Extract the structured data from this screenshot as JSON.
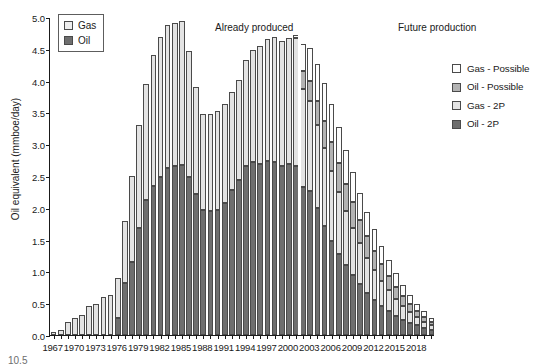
{
  "chart_data": {
    "type": "bar",
    "title": "",
    "xlabel": "",
    "ylabel": "Oil equivalent (mmboe/day)",
    "ylim": [
      0,
      5.0
    ],
    "ytick_labels": [
      "0.0",
      "0.5",
      "1.0",
      "1.5",
      "2.0",
      "2.5",
      "3.0",
      "3.5",
      "4.0",
      "4.5",
      "5.0"
    ],
    "ytick_values": [
      0,
      0.5,
      1.0,
      1.5,
      2.0,
      2.5,
      3.0,
      3.5,
      4.0,
      4.5,
      5.0
    ],
    "grid": false,
    "stacked": true,
    "legend_position": "right",
    "annotations": [
      {
        "text": "Already produced",
        "x": 1988
      },
      {
        "text": "Future production",
        "x": 2012
      }
    ],
    "divider_year": 2001.5,
    "categories": [
      1967,
      1968,
      1969,
      1970,
      1971,
      1972,
      1973,
      1974,
      1975,
      1976,
      1977,
      1978,
      1979,
      1980,
      1981,
      1982,
      1983,
      1984,
      1985,
      1986,
      1987,
      1988,
      1989,
      1990,
      1991,
      1992,
      1993,
      1994,
      1995,
      1996,
      1997,
      1998,
      1999,
      2000,
      2001,
      2002,
      2003,
      2004,
      2005,
      2006,
      2007,
      2008,
      2009,
      2010,
      2011,
      2012,
      2013,
      2014,
      2015,
      2016,
      2017,
      2018,
      2019,
      2020
    ],
    "xtick_labels": [
      "1967",
      "1970",
      "1973",
      "1976",
      "1979",
      "1982",
      "1985",
      "1988",
      "1991",
      "1994",
      "1997",
      "2000",
      "2003",
      "2006",
      "2009",
      "2012",
      "2015",
      "2018"
    ],
    "series": [
      {
        "name": "Oil - 2P",
        "color": "#6e6e6e",
        "values": [
          0.0,
          0.0,
          0.0,
          0.0,
          0.0,
          0.0,
          0.0,
          0.0,
          0.0,
          0.27,
          0.82,
          1.15,
          1.68,
          2.13,
          2.34,
          2.48,
          2.62,
          2.66,
          2.67,
          2.48,
          2.22,
          1.96,
          1.95,
          1.97,
          2.07,
          2.28,
          2.44,
          2.65,
          2.72,
          2.69,
          2.74,
          2.72,
          2.66,
          2.69,
          2.66,
          2.33,
          2.27,
          2.0,
          1.72,
          1.48,
          1.28,
          1.1,
          0.95,
          0.8,
          0.66,
          0.55,
          0.45,
          0.37,
          0.3,
          0.24,
          0.19,
          0.15,
          0.11,
          0.08
        ]
      },
      {
        "name": "Gas - 2P",
        "color": "#e3e3e3",
        "values": [
          0.04,
          0.08,
          0.2,
          0.27,
          0.32,
          0.45,
          0.48,
          0.59,
          0.63,
          0.63,
          0.98,
          1.35,
          1.62,
          1.82,
          2.06,
          2.2,
          2.26,
          2.25,
          2.26,
          1.98,
          1.68,
          1.51,
          1.52,
          1.55,
          1.56,
          1.54,
          1.57,
          1.67,
          1.76,
          1.86,
          1.92,
          1.96,
          1.96,
          1.98,
          2.01,
          1.54,
          1.41,
          1.3,
          1.22,
          1.1,
          0.97,
          0.85,
          0.74,
          0.64,
          0.55,
          0.47,
          0.4,
          0.33,
          0.27,
          0.22,
          0.17,
          0.13,
          0.1,
          0.07
        ]
      },
      {
        "name": "Oil - Possible",
        "color": "#b3b3b3",
        "values": [
          0.0,
          0.0,
          0.0,
          0.0,
          0.0,
          0.0,
          0.0,
          0.0,
          0.0,
          0.0,
          0.0,
          0.0,
          0.0,
          0.0,
          0.0,
          0.0,
          0.0,
          0.0,
          0.0,
          0.0,
          0.0,
          0.0,
          0.0,
          0.0,
          0.0,
          0.0,
          0.0,
          0.0,
          0.0,
          0.0,
          0.0,
          0.0,
          0.0,
          0.0,
          0.0,
          0.28,
          0.32,
          0.38,
          0.42,
          0.45,
          0.45,
          0.43,
          0.4,
          0.37,
          0.34,
          0.3,
          0.26,
          0.23,
          0.19,
          0.16,
          0.13,
          0.1,
          0.08,
          0.06
        ]
      },
      {
        "name": "Gas - Possible",
        "color": "#fdfdfd",
        "values": [
          0.0,
          0.0,
          0.0,
          0.0,
          0.0,
          0.0,
          0.0,
          0.0,
          0.0,
          0.0,
          0.0,
          0.0,
          0.0,
          0.0,
          0.0,
          0.0,
          0.0,
          0.0,
          0.0,
          0.0,
          0.0,
          0.0,
          0.0,
          0.0,
          0.0,
          0.0,
          0.0,
          0.0,
          0.0,
          0.0,
          0.0,
          0.0,
          0.0,
          0.0,
          0.04,
          0.43,
          0.52,
          0.58,
          0.61,
          0.6,
          0.57,
          0.53,
          0.48,
          0.43,
          0.38,
          0.34,
          0.29,
          0.25,
          0.21,
          0.17,
          0.14,
          0.11,
          0.08,
          0.06
        ]
      }
    ]
  },
  "legend_inner": {
    "items": [
      {
        "label": "Gas",
        "color": "#eeeeee"
      },
      {
        "label": "Oil",
        "color": "#6e6e6e"
      }
    ]
  },
  "legend_right": {
    "items": [
      {
        "label": "Gas - Possible",
        "color": "#fdfdfd"
      },
      {
        "label": "Oil - Possible",
        "color": "#b3b3b3"
      },
      {
        "label": "Gas - 2P",
        "color": "#e3e3e3"
      },
      {
        "label": "Oil - 2P",
        "color": "#6e6e6e"
      }
    ]
  },
  "annotations": {
    "already_produced": "Already produced",
    "future_production": "Future production"
  },
  "caption": "10.5"
}
